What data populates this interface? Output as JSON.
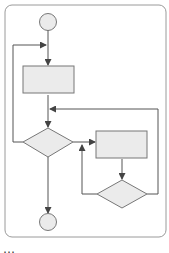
{
  "diagram": {
    "type": "flowchart",
    "colors": {
      "stroke": "#555555",
      "frame": "#9a9a9a",
      "node_fill": "#ebebeb",
      "background": "#ffffff"
    },
    "nodes": [
      {
        "id": "start",
        "shape": "circle",
        "label": ""
      },
      {
        "id": "process-1",
        "shape": "rectangle",
        "label": ""
      },
      {
        "id": "decision-1",
        "shape": "diamond",
        "label": ""
      },
      {
        "id": "process-2",
        "shape": "rectangle",
        "label": ""
      },
      {
        "id": "decision-2",
        "shape": "diamond",
        "label": ""
      },
      {
        "id": "end",
        "shape": "circle",
        "label": ""
      }
    ],
    "edges": [
      {
        "from": "start",
        "to": "process-1"
      },
      {
        "from": "process-1",
        "to": "decision-1"
      },
      {
        "from": "decision-1",
        "to": "process-1",
        "route": "left-loop"
      },
      {
        "from": "decision-1",
        "to": "process-2"
      },
      {
        "from": "process-2",
        "to": "decision-2"
      },
      {
        "from": "decision-2",
        "to": "process-2",
        "route": "left-loop"
      },
      {
        "from": "decision-2",
        "to": "decision-1",
        "route": "right-loop"
      },
      {
        "from": "decision-1",
        "to": "end"
      }
    ]
  },
  "caption": "…"
}
